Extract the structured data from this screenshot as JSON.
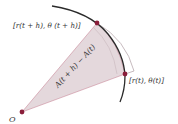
{
  "diagram": {
    "title": "",
    "labels": {
      "upper_point": "[r(t + h), θ (t + h)]",
      "lower_point": "[r(t), θ(t)]",
      "origin": "O",
      "area": "A(t + h) − A(t)"
    },
    "colors": {
      "sector_fill": "#e4d8dc",
      "sector_edge": "#c98a9a",
      "curve": "#2a2a2a",
      "point": "#8a1e3a",
      "outline": "#b9a9ae"
    },
    "points": {
      "origin": [
        22,
        112
      ],
      "upper": [
        97,
        23
      ],
      "lower": [
        125,
        74
      ]
    }
  }
}
